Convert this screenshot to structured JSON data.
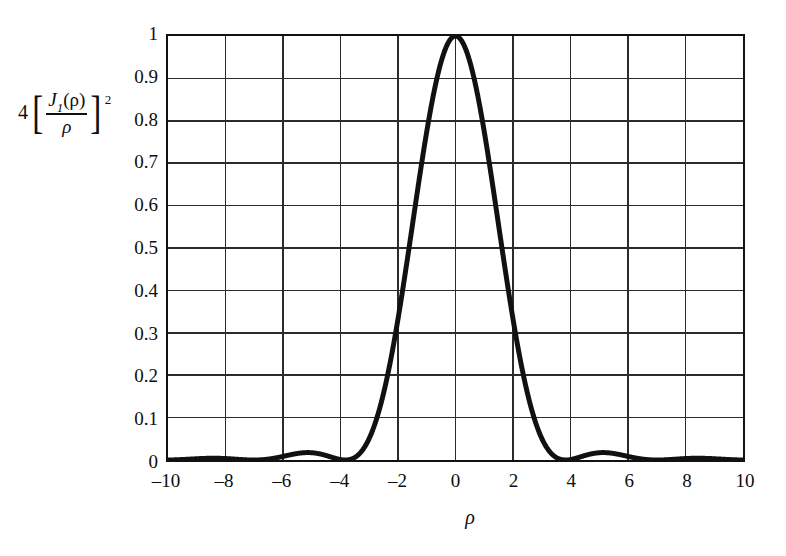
{
  "figure": {
    "background_color": "#ffffff",
    "curve_color": "#111111",
    "grid_color": "#2b2b2b",
    "frame_color": "#111111"
  },
  "axis_titles": {
    "y_expression_plain": "4[J_1(rho)/rho]^2",
    "y_coefficient": "4",
    "y_bracket_left": "[",
    "y_bracket_right": "]",
    "y_numerator_symbol": "J",
    "y_numerator_subscript": "1",
    "y_numerator_argument": "(ρ)",
    "y_denominator": "ρ",
    "y_exponent": "2",
    "x_label": "ρ"
  },
  "chart_data": {
    "type": "line",
    "title": "",
    "subtitle": "",
    "xlabel": "ρ",
    "ylabel": "4[J₁(ρ)/ρ]²",
    "xlim": [
      -10,
      10
    ],
    "ylim": [
      0,
      1
    ],
    "grid": true,
    "legend": null,
    "legend_position": "none",
    "x_ticks": [
      -10,
      -8,
      -6,
      -4,
      -2,
      0,
      2,
      4,
      6,
      8,
      10
    ],
    "x_tick_labels": [
      "–10",
      "–8",
      "–6",
      "–4",
      "–2",
      "0",
      "2",
      "4",
      "6",
      "8",
      "10"
    ],
    "y_ticks": [
      0,
      0.1,
      0.2,
      0.3,
      0.4,
      0.5,
      0.6,
      0.7,
      0.8,
      0.9,
      1
    ],
    "y_tick_labels": [
      "0",
      "0.1",
      "0.2",
      "0.3",
      "0.4",
      "0.5",
      "0.6",
      "0.7",
      "0.8",
      "0.9",
      "1"
    ],
    "x_gridline_step": 2,
    "y_gridline_step": 0.1,
    "series": [
      {
        "name": "4[J1(rho)/rho]^2",
        "description": "Airy diffraction intensity pattern, peak 1 at rho=0, first zeros at rho=±3.83, second zeros at rho=±7.02, third zeros at rho=±10.17",
        "x": [
          -10,
          -9.75,
          -9.5,
          -9.25,
          -9,
          -8.75,
          -8.5,
          -8.25,
          -8,
          -7.75,
          -7.5,
          -7.25,
          -7.016,
          -6.75,
          -6.5,
          -6.25,
          -6,
          -5.75,
          -5.5,
          -5.25,
          -5.136,
          -5,
          -4.75,
          -4.5,
          -4.25,
          -4,
          -3.832,
          -3.6,
          -3.4,
          -3.2,
          -3,
          -2.8,
          -2.6,
          -2.4,
          -2.2,
          -2,
          -1.8,
          -1.6,
          -1.4,
          -1.2,
          -1,
          -0.8,
          -0.6,
          -0.4,
          -0.2,
          0,
          0.2,
          0.4,
          0.6,
          0.8,
          1,
          1.2,
          1.4,
          1.6,
          1.8,
          2,
          2.2,
          2.4,
          2.6,
          2.8,
          3,
          3.2,
          3.4,
          3.6,
          3.832,
          4,
          4.25,
          4.5,
          4.75,
          5,
          5.136,
          5.25,
          5.5,
          5.75,
          6,
          6.25,
          6.5,
          6.75,
          7.016,
          7.25,
          7.5,
          7.75,
          8,
          8.25,
          8.5,
          8.75,
          9,
          9.25,
          9.5,
          9.75,
          10
        ],
        "y": [
          0.00042,
          0.0008,
          0.001,
          0.00094,
          0.00068,
          0.00034,
          9e-05,
          0.0,
          0.00011,
          0.0004,
          0.0008,
          0.00116,
          0.0,
          0.00131,
          0.0032,
          0.0057,
          0.00825,
          0.0116,
          0.0141,
          0.0155,
          0.0175,
          0.0172,
          0.0148,
          0.0101,
          0.0046,
          0.001,
          0.0,
          0.0064,
          0.0168,
          0.0329,
          0.0554,
          0.0843,
          0.1193,
          0.1599,
          0.205,
          0.2539,
          0.3057,
          0.391,
          0.482,
          0.576,
          0.669,
          0.756,
          0.832,
          0.901,
          0.96,
          1.0,
          0.96,
          0.901,
          0.832,
          0.756,
          0.669,
          0.576,
          0.482,
          0.391,
          0.3057,
          0.2539,
          0.205,
          0.1599,
          0.1193,
          0.0843,
          0.0554,
          0.0329,
          0.0168,
          0.0064,
          0.0,
          0.001,
          0.0046,
          0.0101,
          0.0148,
          0.0172,
          0.0175,
          0.0155,
          0.0141,
          0.0116,
          0.00825,
          0.0057,
          0.0032,
          0.00131,
          0.0,
          0.00116,
          0.0008,
          0.0004,
          0.00011,
          0.0,
          9e-05,
          0.00034,
          0.00068,
          0.00094,
          0.001,
          0.0008,
          0.00042
        ],
        "peak_value": 1,
        "peak_x": 0,
        "first_sidelobe_peak_value": 0.0175,
        "first_sidelobe_peak_x": 5.136,
        "line_width_px": 5,
        "color": "#111111"
      }
    ]
  }
}
